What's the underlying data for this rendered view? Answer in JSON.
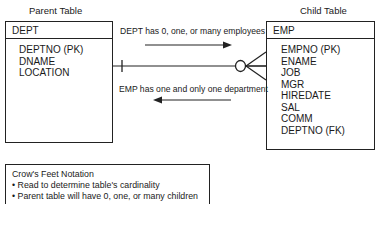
{
  "parent": {
    "caption": "Parent Table",
    "name": "DEPT",
    "fields": [
      "DEPTNO (PK)",
      "DNAME",
      "LOCATION"
    ]
  },
  "child": {
    "caption": "Child Table",
    "name": "EMP",
    "fields": [
      "EMPNO (PK)",
      "ENAME",
      "JOB",
      "MGR",
      "HIREDATE",
      "SAL",
      "COMM",
      "DEPTNO (FK)"
    ]
  },
  "relationship": {
    "forward_label": "DEPT has 0, one, or many employees",
    "backward_label": "EMP has one and only one department",
    "parent_end": "one-and-only-one",
    "child_end": "zero-or-many"
  },
  "legend": {
    "title": "Crow's Feet Notation",
    "bullets": [
      "• Read to determine table's cardinality",
      "• Parent table will have 0, one, or many children"
    ]
  }
}
